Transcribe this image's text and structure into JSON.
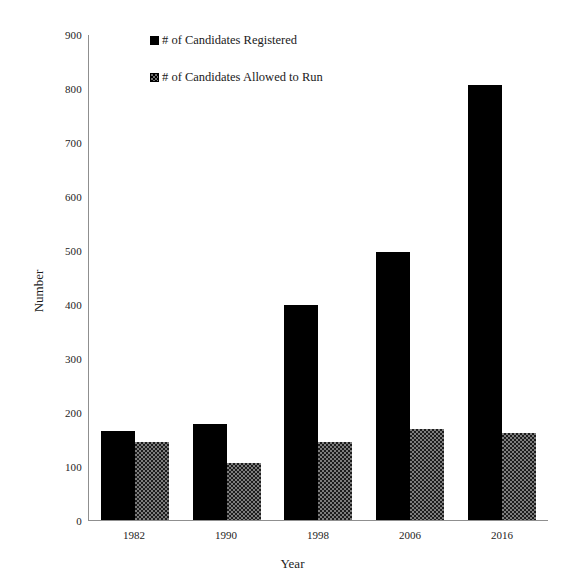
{
  "chart_data": {
    "type": "bar",
    "title": "",
    "subtitle": "",
    "xlabel": "Year",
    "ylabel": "Number",
    "categories": [
      "1982",
      "1990",
      "1998",
      "2006",
      "2016"
    ],
    "series": [
      {
        "name": "# of Candidates Registered",
        "values": [
          165,
          178,
          398,
          497,
          805
        ],
        "color": "#000000",
        "pattern": "solid"
      },
      {
        "name": "# of Candidates Allowed to Run",
        "values": [
          145,
          105,
          145,
          168,
          162
        ],
        "color": "#7d7d7d",
        "pattern": "checkered"
      }
    ],
    "ylim": [
      0,
      900
    ],
    "ytick_labels": [
      "0",
      "100",
      "200",
      "300",
      "400",
      "500",
      "600",
      "700",
      "800",
      "900"
    ],
    "ytick_values": [
      0,
      100,
      200,
      300,
      400,
      500,
      600,
      700,
      800,
      900
    ],
    "grid": false,
    "legend_position": "top-left-inside",
    "background_color": "#ffffff",
    "axis_color": "#8f8f8f"
  },
  "legend": {
    "items": [
      {
        "label": "# of Candidates Registered",
        "swatch": "solid-black-square-icon"
      },
      {
        "label": "# of Candidates Allowed to Run",
        "swatch": "checkered-square-icon"
      }
    ]
  }
}
